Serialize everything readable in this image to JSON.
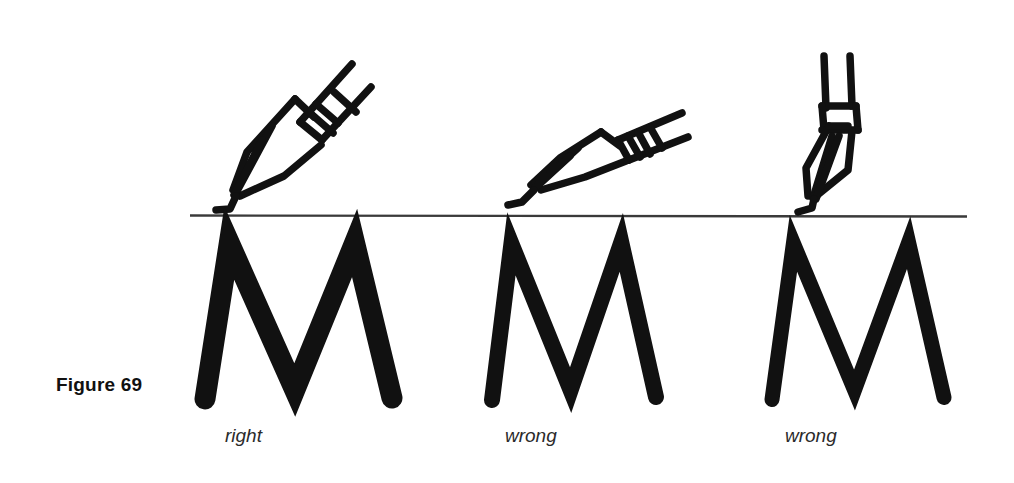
{
  "figure": {
    "label": "Figure 69",
    "background_color": "#ffffff",
    "ink_color": "#111111",
    "rule_color": "#3a3a3a",
    "topic": "pen nib holding angle and resulting letter weight"
  },
  "baseline_rule": {
    "name": "writing-baseline-rule",
    "x_start": 190,
    "x_end": 967,
    "y": 215,
    "thickness": 2.4
  },
  "columns": [
    {
      "id": "col-right",
      "caption": "right",
      "verdict": "right",
      "nib": {
        "name": "pen-nib-steep",
        "angle_description": "about 45 degrees to the baseline",
        "angle_degrees": 45,
        "tip_x": 232,
        "tip_y": 208
      },
      "letter": {
        "glyph": "M",
        "stroke_weight": "heavy",
        "stroke_width": 21,
        "width_description": "wide, well proportioned",
        "left_x": 205,
        "right_x": 392,
        "top_y": 240,
        "baseline_y": 399,
        "slant_degrees": 0
      }
    },
    {
      "id": "col-wrong-shallow",
      "caption": "wrong",
      "verdict": "wrong",
      "nib": {
        "name": "pen-nib-shallow",
        "angle_description": "too flat, nearly parallel to the baseline",
        "angle_degrees": 25,
        "tip_x": 512,
        "tip_y": 208
      },
      "letter": {
        "glyph": "M",
        "stroke_weight": "medium",
        "stroke_width": 16,
        "width_description": "narrow and cramped",
        "left_x": 492,
        "right_x": 656,
        "top_y": 240,
        "baseline_y": 399,
        "slant_degrees": 2
      }
    },
    {
      "id": "col-wrong-upright",
      "caption": "wrong",
      "verdict": "wrong",
      "nib": {
        "name": "pen-nib-upright",
        "angle_description": "too upright, almost perpendicular to the baseline",
        "angle_degrees": 83,
        "tip_x": 806,
        "tip_y": 208
      },
      "letter": {
        "glyph": "M",
        "stroke_weight": "medium-light",
        "stroke_width": 15,
        "width_description": "narrow with thin strokes",
        "left_x": 772,
        "right_x": 944,
        "top_y": 240,
        "baseline_y": 399,
        "slant_degrees": 1
      }
    }
  ]
}
